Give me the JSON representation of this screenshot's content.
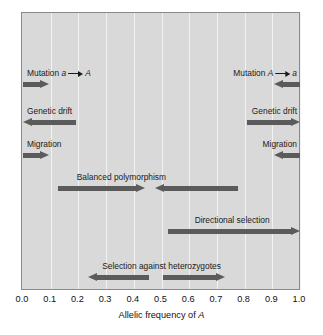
{
  "figure": {
    "background_color": "#ffffff",
    "plot_background_color": "#d9d9d9",
    "arrow_color": "#5b5b5b",
    "gridline_color": "#f2f2f2",
    "border_color": "#8a8a8a"
  },
  "axis": {
    "title_prefix": "Allelic frequency of ",
    "title_italic": "A",
    "min": 0.0,
    "max": 1.0,
    "ticks": [
      "0.0",
      "0.1",
      "0.2",
      "0.3",
      "0.4",
      "0.5",
      "0.6",
      "0.7",
      "0.8",
      "0.9",
      "1.0"
    ],
    "tick_values": [
      0.0,
      0.1,
      0.2,
      0.3,
      0.4,
      0.5,
      0.6,
      0.7,
      0.8,
      0.9,
      1.0
    ]
  },
  "annotations": [
    {
      "id": "mutation-a-to-A",
      "label_prefix": "Mutation ",
      "label_from": "a",
      "label_to": "A",
      "label_has_inline_arrow": true,
      "side": "left",
      "row": 0,
      "arrows": [
        {
          "direction": "right",
          "from": 0.0,
          "to": 0.095
        }
      ]
    },
    {
      "id": "mutation-A-to-a",
      "label_prefix": "Mutation ",
      "label_from": "A",
      "label_to": "a",
      "label_has_inline_arrow": true,
      "side": "right",
      "row": 0,
      "arrows": [
        {
          "direction": "left",
          "from": 1.0,
          "to": 0.905
        }
      ]
    },
    {
      "id": "genetic-drift-left",
      "label": "Genetic drift",
      "side": "left",
      "row": 1,
      "arrows": [
        {
          "direction": "left",
          "from": 0.19,
          "to": 0.0
        }
      ]
    },
    {
      "id": "genetic-drift-right",
      "label": "Genetic drift",
      "side": "right",
      "row": 1,
      "arrows": [
        {
          "direction": "right",
          "from": 0.81,
          "to": 1.0
        }
      ]
    },
    {
      "id": "migration-left",
      "label": "Migration",
      "side": "left",
      "row": 2,
      "arrows": [
        {
          "direction": "right",
          "from": 0.0,
          "to": 0.095
        }
      ]
    },
    {
      "id": "migration-right",
      "label": "Migration",
      "side": "right",
      "row": 2,
      "arrows": [
        {
          "direction": "left",
          "from": 1.0,
          "to": 0.905
        }
      ]
    },
    {
      "id": "balanced-polymorphism",
      "label": "Balanced polymorphism",
      "side": "center",
      "label_center": 0.355,
      "row": 3,
      "arrows": [
        {
          "direction": "right",
          "from": 0.125,
          "to": 0.44
        },
        {
          "direction": "left",
          "from": 0.775,
          "to": 0.475
        }
      ]
    },
    {
      "id": "directional-selection",
      "label": "Directional selection",
      "side": "center",
      "label_center": 0.755,
      "row": 4,
      "arrows": [
        {
          "direction": "right",
          "from": 0.525,
          "to": 1.0
        }
      ]
    },
    {
      "id": "selection-against-heterozygotes",
      "label": "Selection against heterozygotes",
      "side": "center",
      "label_center": 0.5,
      "row": 5,
      "arrows": [
        {
          "direction": "left",
          "from": 0.455,
          "to": 0.235
        },
        {
          "direction": "right",
          "from": 0.505,
          "to": 0.73
        }
      ]
    }
  ]
}
